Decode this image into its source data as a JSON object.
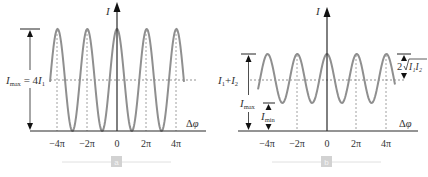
{
  "panels": [
    {
      "id": "a",
      "badge": "a",
      "y_axis_label": "I",
      "x_axis_label": "Δφ",
      "x_ticks": [
        "−4π",
        "−2π",
        "0",
        "2π",
        "4π"
      ],
      "level_label": "I_max = 4I_1",
      "level_label_parts": {
        "I": "I",
        "max": "max",
        "eq": " = 4",
        "I1": "I",
        "sub1": "1"
      }
    },
    {
      "id": "b",
      "badge": "b",
      "y_axis_label": "I",
      "x_axis_label": "Δφ",
      "x_ticks": [
        "−4π",
        "−2π",
        "0",
        "2π",
        "4π"
      ],
      "mid_label": "I1+I2",
      "mid_label_parts": {
        "I": "I",
        "s1": "1",
        "plus": "+",
        "I2": "I",
        "s2": "2"
      },
      "imax_label": {
        "I": "I",
        "sub": "max"
      },
      "imin_label": {
        "I": "I",
        "sub": "min"
      },
      "amp_label": {
        "two": "2",
        "root": "I₁I₂"
      }
    }
  ],
  "chart_data": [
    {
      "type": "line",
      "title": "a",
      "xlabel": "Δφ",
      "ylabel": "I",
      "x_ticks": [
        "-4π",
        "-2π",
        "0",
        "2π",
        "4π"
      ],
      "function": "I = 4 I1 cos^2(Δφ/2)  (equal intensities, full contrast)",
      "annotations": [
        "I_max = 4I_1"
      ],
      "min": 0,
      "max": "4I1"
    },
    {
      "type": "line",
      "title": "b",
      "xlabel": "Δφ",
      "ylabel": "I",
      "x_ticks": [
        "-4π",
        "-2π",
        "0",
        "2π",
        "4π"
      ],
      "function": "I = I1 + I2 + 2√(I1 I2) cos(Δφ)",
      "annotations": [
        "I1+I2",
        "I_max",
        "I_min",
        "2√(I1 I2)"
      ]
    }
  ],
  "colors": {
    "curve": "#8a8a8a",
    "axis": "#2a2a2a",
    "dashed": "#777777",
    "badge": "#cfcfcf",
    "badge_line": "#d8d8d8"
  }
}
